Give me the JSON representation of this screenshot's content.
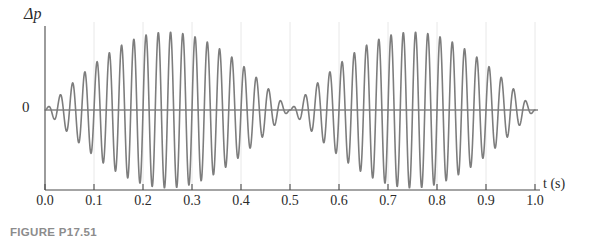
{
  "figure": {
    "caption": "FIGURE P17.51"
  },
  "chart_data": {
    "type": "line",
    "title": "",
    "subtitle": "",
    "xlabel": "t (s)",
    "ylabel": "Δp",
    "xlim": [
      0.0,
      1.0
    ],
    "ylim": [
      -1.05,
      1.05
    ],
    "grid": "vertical-faint",
    "legend_position": "none",
    "x_tick_labels": [
      "0.0",
      "0.1",
      "0.2",
      "0.3",
      "0.4",
      "0.5",
      "0.6",
      "0.7",
      "0.8",
      "0.9",
      "1.0"
    ],
    "x_tick_values": [
      0.0,
      0.1,
      0.2,
      0.3,
      0.4,
      0.5,
      0.6,
      0.7,
      0.8,
      0.9,
      1.0
    ],
    "y_tick_labels": [
      "0"
    ],
    "y_tick_values": [
      0
    ],
    "waveform": {
      "description": "Beat pattern: superposition of two sine waves of nearly equal frequency producing an amplitude envelope with nodes at t = 0, 0.5, 1.0 s and antinodes at t = 0.25, 0.75 s",
      "carrier_frequency_hz": 40,
      "beat_frequency_hz": 2,
      "envelope_period_s": 0.5,
      "amplitude_max": 1.0,
      "node_times_s": [
        0.0,
        0.5,
        1.0
      ],
      "antinode_times_s": [
        0.25,
        0.75
      ],
      "samples_per_second": 2000,
      "color": "#7d7d7d",
      "line_width": 1.6
    },
    "axis_color": "#4a4a4a",
    "grid_color": "#e2e2e2",
    "envelope_amplitudes": {
      "t": [
        0.0,
        0.05,
        0.1,
        0.15,
        0.2,
        0.25,
        0.3,
        0.35,
        0.4,
        0.45,
        0.5,
        0.55,
        0.6,
        0.65,
        0.7,
        0.75,
        0.8,
        0.85,
        0.9,
        0.95,
        1.0
      ],
      "amplitude": [
        0.0,
        0.31,
        0.59,
        0.81,
        0.95,
        1.0,
        0.95,
        0.81,
        0.59,
        0.31,
        0.0,
        0.31,
        0.59,
        0.81,
        0.95,
        1.0,
        0.95,
        0.81,
        0.59,
        0.31,
        0.0
      ]
    }
  },
  "geometry": {
    "plot_left_px": 45,
    "plot_right_px": 535,
    "zero_line_y_px": 110,
    "amplitude_px": 78,
    "axis_baseline_y_px": 190,
    "tick_height_px": 6,
    "grid_top_y_px": 22
  }
}
